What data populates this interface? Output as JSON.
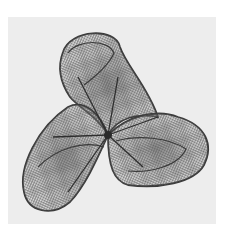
{
  "image": {
    "subject": "wire-mesh sculpture of a three-lobed mathematical surface",
    "background_color": "#ededed",
    "frame_color": "#ffffff",
    "mesh_color": "#5a5a5a",
    "edge_color": "#3a3a3a"
  }
}
